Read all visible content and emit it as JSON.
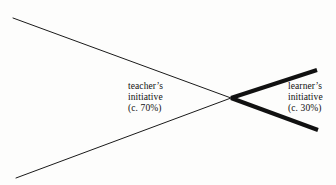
{
  "figure": {
    "background_color": "#fdfdfc",
    "width": 336,
    "height": 185
  },
  "labels": {
    "teacher": {
      "name_line": "teacher’s",
      "noun_line": "initiative",
      "share_line": "(c. 70%)"
    },
    "learner": {
      "name_line": "learner’s",
      "noun_line": "initiative",
      "share_line": "(c. 30%)"
    }
  },
  "chart_data": {
    "type": "diagram",
    "title": "",
    "crossing_point": {
      "x": 231,
      "y": 98
    },
    "series": [
      {
        "name": "teacher's initiative",
        "share_percent": 70,
        "share_label": "(c. 70%)",
        "stroke_width": 1,
        "stroke_color": "#1a1a1a",
        "opens_toward": "left",
        "strokes": [
          {
            "x1": 13,
            "y1": 18,
            "x2": 231,
            "y2": 98
          },
          {
            "x1": 16,
            "y1": 178,
            "x2": 231,
            "y2": 98
          }
        ]
      },
      {
        "name": "learner's initiative",
        "share_percent": 30,
        "share_label": "(c. 30%)",
        "stroke_width": 4,
        "stroke_color": "#111111",
        "opens_toward": "right",
        "strokes": [
          {
            "x1": 231,
            "y1": 98,
            "x2": 317,
            "y2": 70
          },
          {
            "x1": 231,
            "y1": 98,
            "x2": 318,
            "y2": 130
          }
        ]
      }
    ],
    "legend": "none",
    "grid": false
  }
}
